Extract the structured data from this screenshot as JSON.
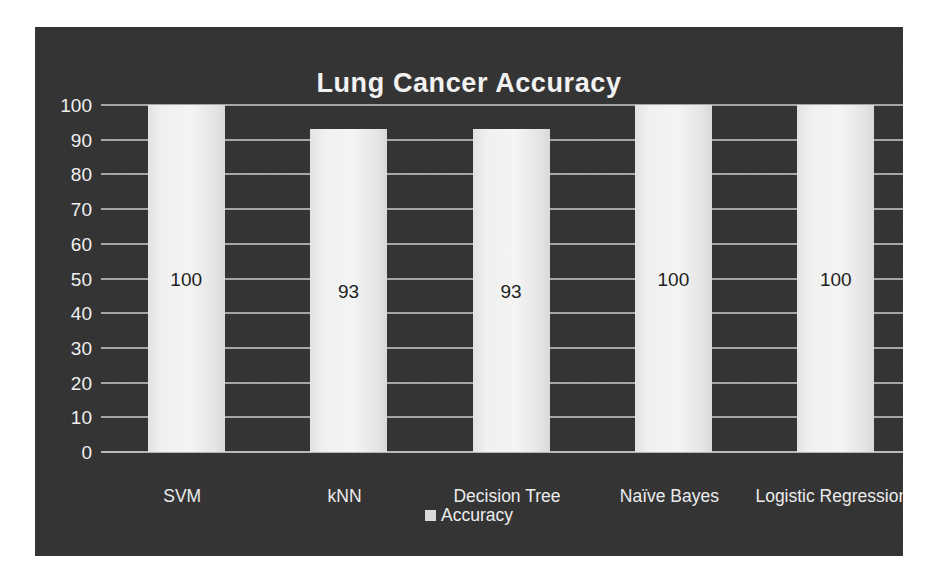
{
  "chart_data": {
    "type": "bar",
    "title": "Lung Cancer Accuracy",
    "categories": [
      "SVM",
      "kNN",
      "Decision Tree",
      "Naïve Bayes",
      "Logistic Regression"
    ],
    "values": [
      100,
      93,
      93,
      100,
      100
    ],
    "data_labels": [
      "100",
      "93",
      "93",
      "100",
      "100"
    ],
    "series": [
      {
        "name": "Accuracy",
        "values": [
          100,
          93,
          93,
          100,
          100
        ]
      }
    ],
    "xlabel": "",
    "ylabel": "",
    "ylim": [
      0,
      100
    ],
    "ytick_labels": [
      "100",
      "90",
      "80",
      "70",
      "60",
      "50",
      "40",
      "30",
      "20",
      "10",
      "0"
    ],
    "ytick_values": [
      100,
      90,
      80,
      70,
      60,
      50,
      40,
      30,
      20,
      10,
      0
    ],
    "grid": true,
    "legend": {
      "position": "bottom",
      "entries": [
        "Accuracy"
      ]
    },
    "colors": {
      "panel_background": "#343434",
      "figure_background": "#ffffff",
      "bar_fill": "#f0f0f0",
      "gridline": "#a6a6a6",
      "text": "#f0f0f0",
      "data_label_text": "#1e1e1e"
    }
  },
  "legend": {
    "swatch_name": "accuracy-color-swatch",
    "label": "Accuracy"
  }
}
